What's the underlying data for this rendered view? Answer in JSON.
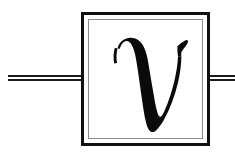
{
  "diagram": {
    "kind": "quantum-circuit-gate",
    "background_color": "#ffffff",
    "ink_color": "#111111",
    "inner_border_color": "#8d8d8d"
  },
  "gate": {
    "label": "v",
    "label_name": "script-v",
    "label_color": "#0a0a0a",
    "box": {
      "x": 81,
      "y": 12,
      "width": 129,
      "height": 134,
      "outer_border_color": "#111111",
      "outer_border_width": 3,
      "inner_border_color": "#8d8d8d",
      "inner_border_width": 1,
      "inner_inset": 6,
      "fill": "#ffffff"
    }
  },
  "wires": {
    "style": "double-line",
    "line_color": "#1a1a1a",
    "line_width": 2,
    "gap": 3,
    "center_y": 78,
    "left": {
      "name": "input-wire",
      "x_start": 8,
      "x_end": 82
    },
    "right": {
      "name": "output-wire",
      "x_start": 209,
      "x_end": 235
    }
  }
}
